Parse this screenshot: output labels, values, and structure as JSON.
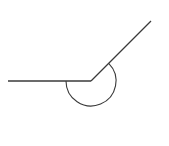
{
  "diagram": {
    "type": "angle",
    "stroke_color": "#3a3a3a",
    "background_color": "#ffffff",
    "vertex": {
      "x": 91,
      "y": 81
    },
    "rays": [
      {
        "name": "horizontal-ray",
        "from": {
          "x": 91,
          "y": 81
        },
        "to": {
          "x": 8,
          "y": 81
        }
      },
      {
        "name": "diagonal-ray",
        "from": {
          "x": 91,
          "y": 81
        },
        "to": {
          "x": 151,
          "y": 21
        }
      }
    ],
    "angle_marker": {
      "kind": "reflex-arc",
      "radius": 25,
      "start_deg": 180,
      "end_deg": 45,
      "measure_deg": 225
    }
  }
}
